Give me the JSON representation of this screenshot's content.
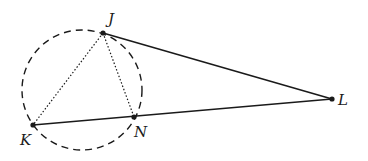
{
  "diagram": {
    "type": "geometry",
    "points": {
      "J": {
        "label": "J",
        "x": 103,
        "y": 33
      },
      "K": {
        "label": "K",
        "x": 33,
        "y": 125
      },
      "N": {
        "label": "N",
        "x": 134,
        "y": 117
      },
      "L": {
        "label": "L",
        "x": 332,
        "y": 99
      }
    },
    "circle": {
      "cx": 82,
      "cy": 90,
      "r": 60,
      "style": "dashed"
    },
    "segments": [
      {
        "from": "J",
        "to": "L",
        "style": "solid"
      },
      {
        "from": "K",
        "to": "L",
        "style": "solid"
      },
      {
        "from": "J",
        "to": "K",
        "style": "dotted"
      },
      {
        "from": "J",
        "to": "N",
        "style": "dotted"
      }
    ],
    "colors": {
      "stroke": "#1a1a1a",
      "background": "#ffffff"
    }
  }
}
